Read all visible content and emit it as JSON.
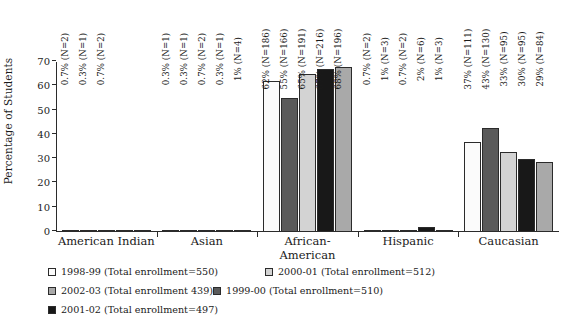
{
  "chart_data": {
    "type": "bar",
    "title": "",
    "xlabel": "",
    "ylabel": "Percentage of Students",
    "ylim": [
      0,
      70
    ],
    "yticks": [
      0,
      10,
      20,
      30,
      40,
      50,
      60,
      70
    ],
    "grid": false,
    "legend_position": "bottom",
    "categories": [
      "American Indian",
      "Asian",
      "African-American",
      "Hispanic",
      "Caucasian"
    ],
    "series": [
      {
        "name": "1998-99 (Total enrollment=550)",
        "color": "#fbfbfb",
        "values": [
          0.7,
          0.3,
          62,
          0.7,
          37
        ],
        "labels": [
          "0.7% (N=2)",
          "0.3% (N=1)",
          "62%  (N=186)",
          "0.7% (N=2)",
          "37% (N=111)"
        ]
      },
      {
        "name": "1999-00 (Total enrollment=510)",
        "color": "#5a5a5a",
        "values": [
          0.3,
          0.3,
          55,
          1,
          43
        ],
        "labels": [
          "0.3% (N=1)",
          "0.3% (N=1)",
          "55% (N=166)",
          "1% (N=3)",
          "43% (N=130)"
        ]
      },
      {
        "name": "2000-01 (Total enrollment=512)",
        "color": "#d3d3d3",
        "values": [
          0.7,
          0.7,
          65,
          0.7,
          33
        ],
        "labels": [
          "0.7% (N=2)",
          "0.7% (N=2)",
          "65% (N=191)",
          "0.7% (N=2)",
          "33% (N=95)"
        ]
      },
      {
        "name": "2001-02 (Total enrollment=497)",
        "color": "#181818",
        "values": [
          0,
          0.3,
          67,
          2,
          30
        ],
        "labels": [
          "",
          "0.3% (N=1)",
          "67% (N=216)",
          "2% (N=6)",
          "30% (N=95)"
        ]
      },
      {
        "name": "2002-03 (Total enrollment 439)",
        "color": "#a9a9a9",
        "values": [
          0,
          1,
          68,
          1,
          29
        ],
        "labels": [
          "",
          "1% (N=4)",
          "68% (N=196)",
          "1% (N=3)",
          "29% (N=84)"
        ]
      }
    ],
    "legend": [
      {
        "label": "1998-99 (Total enrollment=550)",
        "color": "#fbfbfb"
      },
      {
        "label": "2000-01 (Total enrollment=512)",
        "color": "#d3d3d3"
      },
      {
        "label": "2002-03 (Total enrollment 439)",
        "color": "#a9a9a9"
      },
      {
        "label": "1999-00 (Total enrollment=510)",
        "color": "#5a5a5a"
      },
      {
        "label": "2001-02 (Total enrollment=497)",
        "color": "#181818"
      }
    ]
  }
}
